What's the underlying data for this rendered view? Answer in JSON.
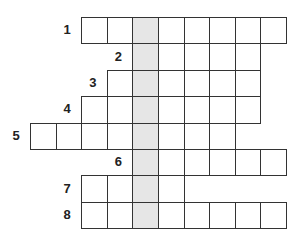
{
  "puzzle": {
    "type": "crossword",
    "highlight_color": "#e6e6e6",
    "line_color": "#333333",
    "highlight_column": 4,
    "rows": [
      {
        "number": "1",
        "start_col": 2,
        "length": 8
      },
      {
        "number": "2",
        "start_col": 4,
        "length": 5
      },
      {
        "number": "3",
        "start_col": 3,
        "length": 6
      },
      {
        "number": "4",
        "start_col": 2,
        "length": 7
      },
      {
        "number": "5",
        "start_col": 0,
        "length": 8
      },
      {
        "number": "6",
        "start_col": 4,
        "length": 6
      },
      {
        "number": "7",
        "start_col": 2,
        "length": 4
      },
      {
        "number": "8",
        "start_col": 2,
        "length": 8
      }
    ]
  }
}
